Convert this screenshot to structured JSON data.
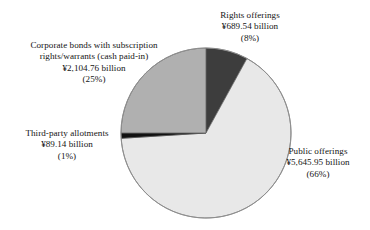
{
  "chart_data": {
    "type": "pie",
    "title": "",
    "subtitle": "",
    "xlabel": "",
    "ylabel": "",
    "legend_position": "none",
    "grid": false,
    "currency": "¥",
    "units": "billion",
    "total_value": 8529.39,
    "start_angle": 0,
    "direction": "clockwise",
    "categories": [
      "Rights offerings",
      "Public offerings",
      "Third-party allotments",
      "Corporate bonds with subscription rights/warrants (cash paid-in)"
    ],
    "values": [
      689.54,
      5645.95,
      89.14,
      2104.76
    ],
    "percents": [
      8,
      66,
      1,
      25
    ],
    "colors": [
      "#3d3d3d",
      "#e8e8e8",
      "#111111",
      "#b0b0b0"
    ],
    "slices": [
      {
        "name": "Rights offerings",
        "value": 689.54,
        "percent": 8,
        "color": "#3d3d3d",
        "start_angle": 0,
        "end_angle": 28.8
      },
      {
        "name": "Public offerings",
        "value": 5645.95,
        "percent": 66,
        "color": "#e8e8e8",
        "start_angle": 28.8,
        "end_angle": 266.4
      },
      {
        "name": "Third-party allotments",
        "value": 89.14,
        "percent": 1,
        "color": "#111111",
        "start_angle": 266.4,
        "end_angle": 270.0
      },
      {
        "name": "Corporate bonds with subscription rights/warrants (cash paid-in)",
        "value": 2104.76,
        "percent": 25,
        "color": "#b0b0b0",
        "start_angle": 270.0,
        "end_angle": 360.0
      }
    ]
  },
  "labels": {
    "rights": {
      "line1": "Rights offerings",
      "line2": "¥689.54 billion",
      "line3": "(8%)"
    },
    "corporate": {
      "line1": "Corporate bonds with subscription",
      "line2": "rights/warrants (cash paid-in)",
      "line3": "¥2,104.76 billion",
      "line4": "(25%)"
    },
    "thirdparty": {
      "line1": "Third-party allotments",
      "line2": "¥89.14 billion",
      "line3": "(1%)"
    },
    "public": {
      "line1": "Public offerings",
      "line2": "¥5,645.95 billion",
      "line3": "(66%)"
    }
  },
  "style": {
    "background": "#ffffff",
    "outline": "#8e8e8e",
    "text": "#141414"
  }
}
